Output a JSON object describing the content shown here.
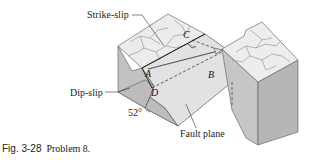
{
  "figure": {
    "type": "fault block diagram",
    "labels": {
      "strike_slip": "Strike-slip",
      "dip_slip": "Dip-slip",
      "fault_plane": "Fault plane",
      "angle": "52°"
    },
    "points": {
      "A": "A",
      "B": "B",
      "C": "C",
      "D": "D"
    },
    "colors": {
      "top_face": "#ececec",
      "side_face_dark": "#bdbdbd",
      "side_face_mid": "#cfcfcf",
      "fault_plane": "#e4e4e4",
      "cracks": "#9a9a9a",
      "lines": "#333333"
    }
  },
  "caption": {
    "fig_number": "Fig. 3-28",
    "text": "Problem 8."
  }
}
